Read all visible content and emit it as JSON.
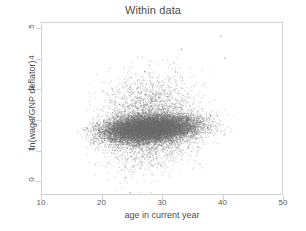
{
  "chart_data": {
    "type": "scatter",
    "title": "Within data",
    "xlabel": "age in current year",
    "ylabel": "ln(wage/GNP deflator)",
    "xlim": [
      10,
      50
    ],
    "ylim": [
      -0.45,
      5.2
    ],
    "xticks": [
      10,
      20,
      30,
      40,
      50
    ],
    "xtick_labels": [
      "10",
      "20",
      "30",
      "40",
      "50"
    ],
    "yticks": [
      0,
      1,
      2,
      3,
      4,
      5
    ],
    "ytick_labels": [
      "0",
      "1",
      "2",
      "3",
      "4",
      "5"
    ],
    "grid": false,
    "legend": null,
    "marker": {
      "color": "#6b6b6b",
      "size": 1.1,
      "opacity": 0.34,
      "shape": "circle"
    },
    "n_points": 17000,
    "distribution": {
      "x_range": [
        14.8,
        44.2
      ],
      "x_mode": 27.0,
      "x_spread": 6.0,
      "y_center_at_x_min": 1.56,
      "y_center_at_x_max": 1.93,
      "y_core_sd": 0.22,
      "y_tail_sd": 0.62,
      "tail_fraction": 0.17,
      "y_clip": [
        -0.45,
        5.05
      ]
    },
    "outliers": [
      {
        "x": 39.7,
        "y": 4.78
      },
      {
        "x": 33.1,
        "y": 4.35
      },
      {
        "x": 24.6,
        "y": -0.38
      },
      {
        "x": 40.4,
        "y": 4.06
      },
      {
        "x": 27.0,
        "y": 3.62
      }
    ],
    "axis_color": "#d2d2d2",
    "text_color": "#4d4d4d"
  }
}
